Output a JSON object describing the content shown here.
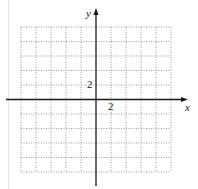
{
  "diagram": {
    "type": "coordinate-plane",
    "grid": {
      "columns": 10,
      "rows": 10,
      "style": "dotted",
      "color": "#9a9a9a"
    },
    "axes": {
      "x": {
        "label": "x",
        "tick_label": "2"
      },
      "y": {
        "label": "y",
        "tick_label": "2"
      },
      "color": "#1a1a1a"
    }
  }
}
